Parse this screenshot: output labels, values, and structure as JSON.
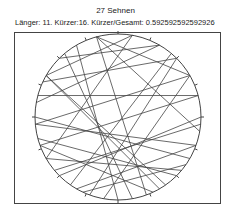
{
  "title": "27 Sehnen",
  "subtitle": "Länger: 11. Kürzer:16. Kürzer/Gesamt: 0.592592592592926",
  "colors": {
    "line": "#444444",
    "background": "#ffffff"
  },
  "diagram": {
    "circle": {
      "cx": 118,
      "cy": 117,
      "r": 83
    },
    "tick_count": 16,
    "chord_count": 27,
    "chords_deg": [
      [
        345,
        60
      ],
      [
        345,
        100
      ],
      [
        345,
        160
      ],
      [
        10,
        300
      ],
      [
        10,
        240
      ],
      [
        30,
        280
      ],
      [
        30,
        315
      ],
      [
        45,
        295
      ],
      [
        45,
        200
      ],
      [
        60,
        265
      ],
      [
        75,
        250
      ],
      [
        75,
        285
      ],
      [
        95,
        230
      ],
      [
        110,
        210
      ],
      [
        110,
        265
      ],
      [
        125,
        205
      ],
      [
        135,
        255
      ],
      [
        145,
        300
      ],
      [
        155,
        250
      ],
      [
        170,
        320
      ],
      [
        180,
        330
      ],
      [
        190,
        60
      ],
      [
        215,
        40
      ],
      [
        225,
        90
      ],
      [
        240,
        130
      ],
      [
        270,
        120
      ],
      [
        300,
        150
      ]
    ]
  }
}
